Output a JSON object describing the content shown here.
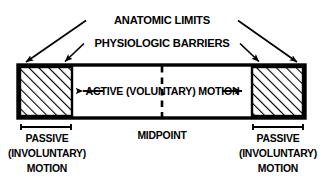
{
  "figure": {
    "title_top": "ANATOMIC LIMITS",
    "title_second": "PHYSIOLOGIC BARRIERS",
    "center_label": "ACTIVE (VOLUNTARY) MOTION",
    "midpoint_label": "MIDPOINT",
    "left_caption": {
      "line1": "PASSIVE",
      "line2": "(INVOLUNTARY)",
      "line3": "MOTION"
    },
    "right_caption": {
      "line1": "PASSIVE",
      "line2": "(INVOLUNTARY)",
      "line3": "MOTION"
    },
    "colors": {
      "ink": "#000000",
      "background": "#ffffff",
      "hatch": "#000000"
    }
  }
}
